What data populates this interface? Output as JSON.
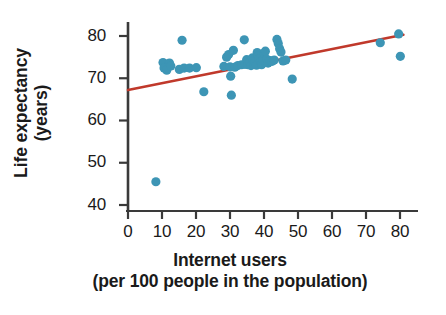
{
  "chart_data": {
    "type": "scatter",
    "title": "",
    "xlabel": "Internet users (per 100 people in the population)",
    "ylabel": "Life expectancy (years)",
    "xlim": [
      0,
      81
    ],
    "ylim": [
      38,
      82
    ],
    "xticks": [
      0,
      10,
      20,
      30,
      40,
      50,
      60,
      70,
      80
    ],
    "yticks": [
      40,
      50,
      60,
      70,
      80
    ],
    "grid": false,
    "legend": "none",
    "point_color": "#3d95b5",
    "trendline_color": "#c0392b",
    "axis_color": "#3a3a3a",
    "trendline": {
      "type": "linear",
      "x_start": 0,
      "y_start": 67.2,
      "x_end": 81,
      "y_end": 80.3
    },
    "points": [
      {
        "x": 8.2,
        "y": 45.5
      },
      {
        "x": 10.3,
        "y": 73.7
      },
      {
        "x": 10.6,
        "y": 72.4
      },
      {
        "x": 11.4,
        "y": 71.9
      },
      {
        "x": 12.2,
        "y": 73.6
      },
      {
        "x": 12.6,
        "y": 72.9
      },
      {
        "x": 15.1,
        "y": 72.1
      },
      {
        "x": 15.9,
        "y": 79.0
      },
      {
        "x": 16.5,
        "y": 72.4
      },
      {
        "x": 18.1,
        "y": 72.4
      },
      {
        "x": 20.1,
        "y": 72.5
      },
      {
        "x": 22.3,
        "y": 66.8
      },
      {
        "x": 28.2,
        "y": 72.8
      },
      {
        "x": 29.0,
        "y": 75.0
      },
      {
        "x": 29.6,
        "y": 75.6
      },
      {
        "x": 30.0,
        "y": 72.7
      },
      {
        "x": 30.2,
        "y": 70.5
      },
      {
        "x": 30.4,
        "y": 66.0
      },
      {
        "x": 31.0,
        "y": 76.6
      },
      {
        "x": 31.4,
        "y": 72.6
      },
      {
        "x": 32.3,
        "y": 73.0
      },
      {
        "x": 33.4,
        "y": 73.2
      },
      {
        "x": 34.2,
        "y": 79.1
      },
      {
        "x": 34.4,
        "y": 73.3
      },
      {
        "x": 34.9,
        "y": 74.4
      },
      {
        "x": 35.3,
        "y": 73.2
      },
      {
        "x": 35.8,
        "y": 73.9
      },
      {
        "x": 36.2,
        "y": 73.0
      },
      {
        "x": 36.6,
        "y": 74.8
      },
      {
        "x": 37.0,
        "y": 73.4
      },
      {
        "x": 37.4,
        "y": 74.0
      },
      {
        "x": 37.8,
        "y": 73.1
      },
      {
        "x": 38.0,
        "y": 76.1
      },
      {
        "x": 38.3,
        "y": 75.3
      },
      {
        "x": 38.6,
        "y": 74.6
      },
      {
        "x": 39.0,
        "y": 73.8
      },
      {
        "x": 39.3,
        "y": 73.2
      },
      {
        "x": 39.6,
        "y": 74.3
      },
      {
        "x": 40.0,
        "y": 75.9
      },
      {
        "x": 40.4,
        "y": 76.4
      },
      {
        "x": 40.8,
        "y": 74.5
      },
      {
        "x": 41.2,
        "y": 73.6
      },
      {
        "x": 41.8,
        "y": 74.2
      },
      {
        "x": 42.4,
        "y": 74.0
      },
      {
        "x": 43.0,
        "y": 74.3
      },
      {
        "x": 43.8,
        "y": 79.2
      },
      {
        "x": 44.2,
        "y": 78.2
      },
      {
        "x": 44.6,
        "y": 77.0
      },
      {
        "x": 45.0,
        "y": 76.2
      },
      {
        "x": 45.6,
        "y": 74.1
      },
      {
        "x": 46.4,
        "y": 74.3
      },
      {
        "x": 48.3,
        "y": 69.8
      },
      {
        "x": 74.2,
        "y": 78.4
      },
      {
        "x": 79.6,
        "y": 80.5
      },
      {
        "x": 80.1,
        "y": 75.2
      }
    ]
  },
  "axes": {
    "y_tick_labels": [
      "80",
      "70",
      "60",
      "50",
      "40"
    ],
    "x_tick_labels": [
      "0",
      "10",
      "20",
      "30",
      "40",
      "50",
      "60",
      "70",
      "80"
    ],
    "y_title_lines": [
      "Life expectancy",
      "(years)"
    ],
    "x_title_lines": [
      "Internet users",
      "(per 100 people in the population)"
    ]
  }
}
